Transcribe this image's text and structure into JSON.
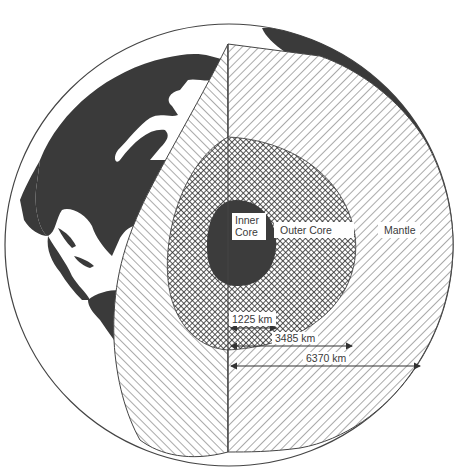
{
  "figure": {
    "type": "cutaway-globe"
  },
  "layers": [
    {
      "id": "inner_core",
      "label_line1": "Inner",
      "label_line2": "Core",
      "fill": "#3c3c3c"
    },
    {
      "id": "outer_core",
      "label": "Outer Core",
      "fill": "crosshatch"
    },
    {
      "id": "mantle",
      "label": "Mantle",
      "fill": "diagonal-hatch"
    }
  ],
  "measurements": [
    {
      "label": "1225 km",
      "layer": "inner_core"
    },
    {
      "label": "3485 km",
      "layer": "outer_core"
    },
    {
      "label": "6370 km",
      "layer": "surface"
    }
  ],
  "colors": {
    "land": "#3a3a3a",
    "ocean": "#ffffff",
    "hatch": "#555555",
    "outline": "#444444"
  }
}
